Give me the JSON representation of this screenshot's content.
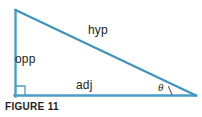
{
  "figure": {
    "caption": "FIGURE 11",
    "type": "right-triangle-trigonometry-diagram",
    "labels": {
      "opposite": "opp",
      "hypotenuse": "hyp",
      "adjacent": "adj",
      "angle": "θ"
    },
    "colors": {
      "stroke": "#4a9dc4",
      "text": "#231f20",
      "background": "#ffffff"
    },
    "geometry": {
      "apex_vertex": "15,10",
      "right_angle_vertex": "15,96",
      "angle_vertex": "196,96",
      "right_angle_marker": "present",
      "angle_arc_marker": "present"
    }
  }
}
